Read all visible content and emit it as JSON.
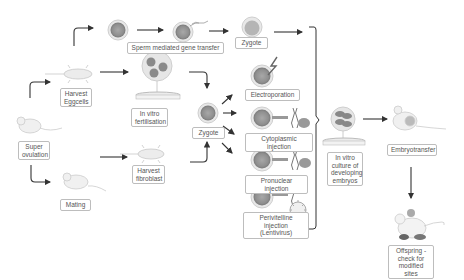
{
  "diagram": {
    "labels": {
      "super_ovulation": "Super\novulation",
      "harvest_eggcells": "Harvest\nEggcells",
      "mating": "Mating",
      "harvest_fibroblast": "Harvest\nfibroblast",
      "in_vitro_fertilisation": "In vitro\nfertilisation",
      "sperm_mediated": "Sperm mediated gene transfer",
      "zygote_top": "Zygote",
      "zygote_mid": "Zygote",
      "electroporation": "Electroporation",
      "cytoplasmic_injection": "Cytoplasmic injection",
      "pronuclear_injection": "Pronuclear injection",
      "perivitelline_injection": "Perivitelline injection\n(Lentivirus)",
      "in_vitro_culture": "In vitro\nculture of\ndeveloping\nembryos",
      "embryotransfer": "Embryotransfer",
      "offspring": "Offspring -\ncheck for\nmodified sites"
    },
    "colors": {
      "cell_fill": "#9e9e9e",
      "cell_ring": "#d6d6d6",
      "arrow": "#333333",
      "label_border": "#bdbdbd",
      "text": "#555555"
    }
  }
}
